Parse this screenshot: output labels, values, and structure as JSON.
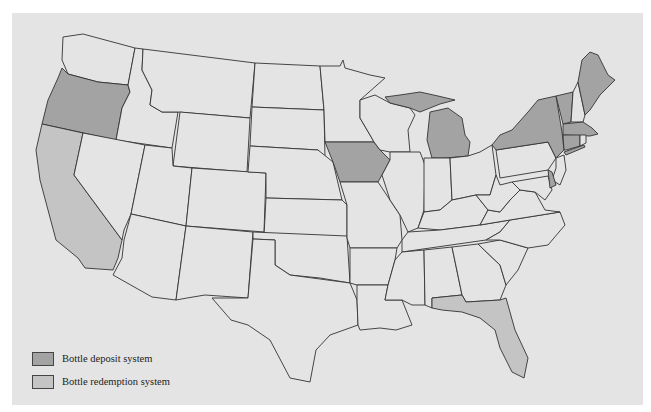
{
  "map": {
    "title": "",
    "colors": {
      "background": "#e4e4e4",
      "deposit": "#a3a3a3",
      "redemption": "#c4c4c4",
      "border": "#333333"
    },
    "deposit_states": [
      "Oregon",
      "Iowa",
      "Michigan",
      "New York",
      "Vermont",
      "Maine",
      "Massachusetts",
      "Connecticut",
      "Delaware"
    ],
    "redemption_states": [
      "California",
      "Florida"
    ]
  },
  "legend": {
    "items": [
      {
        "label": "Bottle deposit system",
        "color": "#a3a3a3"
      },
      {
        "label": "Bottle redemption system",
        "color": "#c4c4c4"
      }
    ]
  }
}
